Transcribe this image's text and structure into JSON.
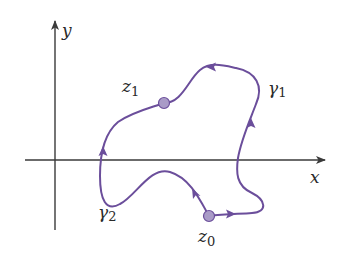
{
  "diagram": {
    "type": "complex-plane-contours",
    "axes": {
      "x_label": "x",
      "y_label": "y",
      "color": "#3a3a3a"
    },
    "points": [
      {
        "id": "z0",
        "label_base": "z",
        "label_sub": "0"
      },
      {
        "id": "z1",
        "label_base": "z",
        "label_sub": "1"
      }
    ],
    "paths": [
      {
        "id": "gamma1",
        "label_base": "γ",
        "label_sub": "1",
        "from": "z0",
        "to": "z1",
        "via": "right"
      },
      {
        "id": "gamma2",
        "label_base": "γ",
        "label_sub": "2",
        "from": "z0",
        "to": "z1",
        "via": "left"
      }
    ],
    "colors": {
      "curve": "#6b4e9b",
      "point_fill": "#a99bc7",
      "point_stroke": "#6b4e9b",
      "text": "#2a2a2a"
    }
  }
}
